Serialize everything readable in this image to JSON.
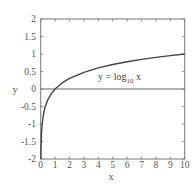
{
  "chart_data": {
    "type": "line",
    "title": "",
    "xlabel": "x",
    "ylabel": "y",
    "xlim": [
      0,
      10
    ],
    "ylim": [
      -2,
      2
    ],
    "grid": false,
    "x_ticks": [
      0,
      1,
      2,
      3,
      4,
      5,
      6,
      7,
      8,
      9,
      10
    ],
    "x_tick_labels": [
      "0",
      "1",
      "2",
      "3",
      "4",
      "5",
      "6",
      "7",
      "8",
      "9",
      "10"
    ],
    "y_ticks": [
      -2,
      -1.5,
      -1,
      -0.5,
      0,
      0.5,
      1,
      1.5,
      2
    ],
    "y_tick_labels": [
      "-2",
      "-1.5",
      "-1",
      "-0.5",
      "0",
      "0.5",
      "1",
      "1.5",
      "2"
    ],
    "series": [
      {
        "name": "y = log10 x",
        "color": "#444444",
        "x": [
          0.01,
          0.02,
          0.05,
          0.1,
          0.2,
          0.3,
          0.5,
          0.75,
          1,
          1.5,
          2,
          3,
          4,
          5,
          6,
          7,
          8,
          9,
          10
        ],
        "y": [
          -2,
          -1.699,
          -1.301,
          -1,
          -0.699,
          -0.523,
          -0.301,
          -0.125,
          0,
          0.176,
          0.301,
          0.477,
          0.602,
          0.699,
          0.778,
          0.845,
          0.903,
          0.954,
          1
        ]
      },
      {
        "name": "y = 0",
        "color": "#666666",
        "x": [
          0,
          10
        ],
        "y": [
          0,
          0
        ]
      }
    ],
    "annotations": [
      {
        "text_main": "y = log",
        "text_sub": "10",
        "text_tail": " x",
        "x": 4,
        "y": 0.35
      }
    ],
    "legend": null
  },
  "colors": {
    "frame": "#777777",
    "curve": "#444444",
    "zero_line": "#666666",
    "text": "#555555"
  }
}
